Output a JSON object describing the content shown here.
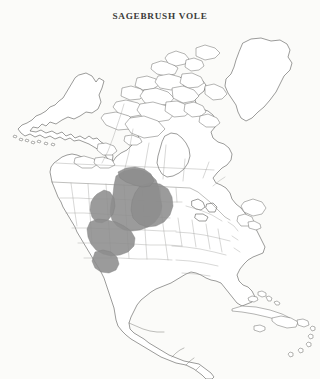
{
  "page": {
    "background_color": "#fbfbf9",
    "cutoff_text_above": "",
    "scan_artifact_note": ""
  },
  "figure": {
    "title": "SAGEBRUSH VOLE",
    "title_color": "#3a3a38"
  },
  "map": {
    "name": "north-america-distribution-map",
    "projection_region": "North America",
    "land_fill": "#ffffff",
    "coastline_color": "#4a4a48",
    "internal_border_color": "#9d9d99",
    "national_border_color": "#6f6f6c",
    "landmasses": [
      "Alaska",
      "Aleutian Islands",
      "Canada",
      "Canadian Arctic Archipelago",
      "Greenland",
      "United States",
      "Mexico",
      "Central America",
      "Cuba",
      "Hispaniola",
      "Puerto Rico",
      "Lesser Antilles",
      "Bahamas"
    ],
    "distribution_range": {
      "label": "shaded distribution range",
      "fill_color": "#8d8d8d",
      "region_description": "Great Basin, Northern Rocky Mountains and Northern Great Plains",
      "states_covered": [
        "Washington",
        "Oregon",
        "Idaho",
        "Nevada",
        "Utah",
        "Montana",
        "Wyoming",
        "Colorado",
        "North Dakota",
        "South Dakota",
        "Nebraska",
        "Alberta",
        "Saskatchewan"
      ]
    }
  }
}
